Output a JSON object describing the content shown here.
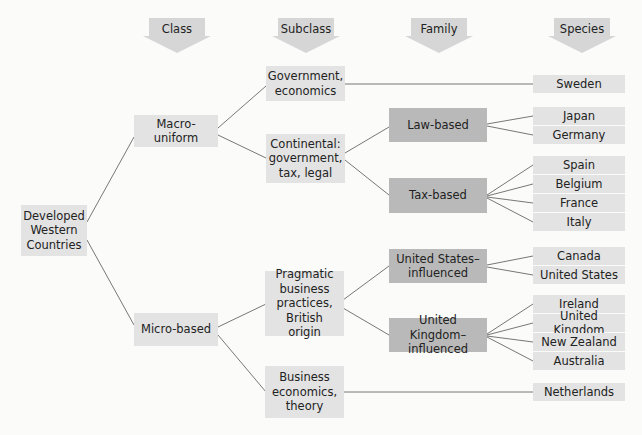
{
  "headers": [
    "Class",
    "Subclass",
    "Family",
    "Species"
  ],
  "root": "Developed\nWestern\nCountries",
  "classes": [
    "Macro-uniform",
    "Micro-based"
  ],
  "subclasses": [
    "Government,\neconomics",
    "Continental:\ngovernment,\ntax, legal",
    "Pragmatic\nbusiness\npractices,\nBritish origin",
    "Business\neconomics,\ntheory"
  ],
  "families": [
    "Law-based",
    "Tax-based",
    "United States–\ninfluenced",
    "United Kingdom–\ninfluenced"
  ],
  "species": [
    "Sweden",
    "Japan",
    "Germany",
    "Spain",
    "Belgium",
    "France",
    "Italy",
    "Canada",
    "United States",
    "Ireland",
    "United Kingdom",
    "New Zealand",
    "Australia",
    "Netherlands"
  ],
  "colors": {
    "light_box": "#e3e3e3",
    "dark_box": "#b9b9b9",
    "arrow": "#d6d6d6",
    "line": "#555555"
  }
}
